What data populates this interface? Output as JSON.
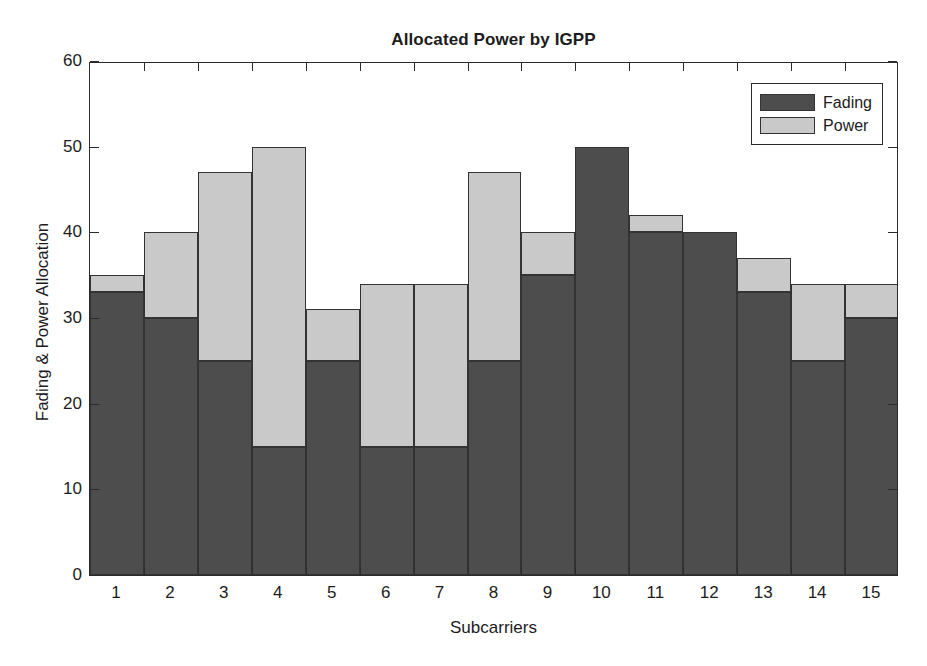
{
  "chart_data": {
    "type": "bar",
    "subtype": "stacked",
    "title": "Allocated Power by IGPP",
    "xlabel": "Subcarriers",
    "ylabel": "Fading & Power Allocation",
    "categories": [
      "1",
      "2",
      "3",
      "4",
      "5",
      "6",
      "7",
      "8",
      "9",
      "10",
      "11",
      "12",
      "13",
      "14",
      "15"
    ],
    "series": [
      {
        "name": "Fading",
        "color": "#4d4d4d",
        "values": [
          33,
          30,
          25,
          15,
          25,
          15,
          15,
          25,
          35,
          50,
          40,
          40,
          33,
          25,
          30
        ]
      },
      {
        "name": "Power",
        "color": "#c9c9c9",
        "values": [
          2,
          10,
          22,
          35,
          6,
          19,
          19,
          22,
          5,
          0,
          2,
          0,
          4,
          9,
          4
        ]
      }
    ],
    "totals": [
      35,
      40,
      47,
      50,
      31,
      34,
      34,
      47,
      40,
      50,
      42,
      40,
      37,
      34,
      34
    ],
    "ylim": [
      0,
      60
    ],
    "yticks": [
      0,
      10,
      20,
      30,
      40,
      50,
      60
    ],
    "ytick_labels": [
      "0",
      "10",
      "20",
      "30",
      "40",
      "50",
      "60"
    ],
    "xlim": [
      0.5,
      15.5
    ],
    "grid": false,
    "legend_position": "top-right",
    "legend_entries": [
      "Fading",
      "Power"
    ],
    "background_color": "#ffffff",
    "axis_color": "#2b2b2b"
  }
}
